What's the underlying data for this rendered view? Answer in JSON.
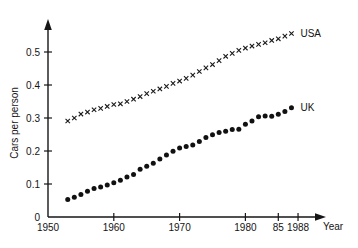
{
  "chart_data": {
    "type": "scatter",
    "title": "",
    "xlabel": "Year",
    "ylabel": "Cars per person",
    "xlim": [
      1950,
      1990
    ],
    "ylim": [
      0,
      0.58
    ],
    "grid": false,
    "legend_position": "right-of-series-end",
    "x_ticks": [
      {
        "value": 1950,
        "label": "1950"
      },
      {
        "value": 1960,
        "label": "1960"
      },
      {
        "value": 1970,
        "label": "1970"
      },
      {
        "value": 1980,
        "label": "1980"
      },
      {
        "value": 1985,
        "label": "85"
      },
      {
        "value": 1988,
        "label": "1988"
      }
    ],
    "y_ticks": [
      {
        "value": 0,
        "label": "0"
      },
      {
        "value": 0.1,
        "label": "0.1"
      },
      {
        "value": 0.2,
        "label": "0.2"
      },
      {
        "value": 0.3,
        "label": "0.3"
      },
      {
        "value": 0.4,
        "label": "0.4"
      },
      {
        "value": 0.5,
        "label": "0.5"
      }
    ],
    "series": [
      {
        "name": "USA",
        "marker": "x",
        "label": "USA",
        "x": [
          1953,
          1954,
          1955,
          1956,
          1957,
          1958,
          1959,
          1960,
          1961,
          1962,
          1963,
          1964,
          1965,
          1966,
          1967,
          1968,
          1969,
          1970,
          1971,
          1972,
          1973,
          1974,
          1975,
          1976,
          1977,
          1978,
          1979,
          1980,
          1981,
          1982,
          1983,
          1984,
          1985,
          1986,
          1987
        ],
        "values": [
          0.291,
          0.3,
          0.312,
          0.318,
          0.325,
          0.329,
          0.335,
          0.341,
          0.343,
          0.35,
          0.357,
          0.365,
          0.374,
          0.381,
          0.388,
          0.396,
          0.405,
          0.412,
          0.42,
          0.43,
          0.441,
          0.452,
          0.462,
          0.474,
          0.487,
          0.496,
          0.505,
          0.512,
          0.518,
          0.523,
          0.528,
          0.535,
          0.54,
          0.548,
          0.556
        ]
      },
      {
        "name": "UK",
        "marker": "dot",
        "label": "UK",
        "x": [
          1953,
          1954,
          1955,
          1956,
          1957,
          1958,
          1959,
          1960,
          1961,
          1962,
          1963,
          1964,
          1965,
          1966,
          1967,
          1968,
          1969,
          1970,
          1971,
          1972,
          1973,
          1974,
          1975,
          1976,
          1977,
          1978,
          1979,
          1980,
          1981,
          1982,
          1983,
          1984,
          1985,
          1986,
          1987
        ],
        "values": [
          0.053,
          0.06,
          0.068,
          0.078,
          0.086,
          0.091,
          0.097,
          0.104,
          0.111,
          0.121,
          0.129,
          0.145,
          0.154,
          0.163,
          0.176,
          0.188,
          0.199,
          0.209,
          0.214,
          0.218,
          0.229,
          0.241,
          0.249,
          0.256,
          0.26,
          0.265,
          0.266,
          0.281,
          0.291,
          0.304,
          0.306,
          0.305,
          0.311,
          0.32,
          0.331
        ]
      }
    ]
  },
  "labels": {
    "x_axis_title": "Year",
    "y_axis_title": "Cars per person"
  }
}
